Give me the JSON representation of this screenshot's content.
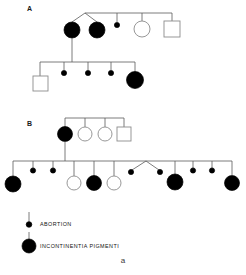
{
  "figure": {
    "caption": "a",
    "panels": [
      {
        "id": "A",
        "label": "A",
        "generations": [
          {
            "name": "generation-1",
            "members": [
              {
                "symbol": "filled-circle",
                "meaning": "incontinentia-pigmenti"
              },
              {
                "symbol": "filled-circle",
                "meaning": "incontinentia-pigmenti"
              },
              {
                "symbol": "dot",
                "meaning": "abortion"
              },
              {
                "symbol": "open-circle",
                "meaning": "unaffected-female"
              },
              {
                "symbol": "open-square",
                "meaning": "unaffected-male"
              }
            ]
          },
          {
            "name": "generation-2",
            "members": [
              {
                "symbol": "open-square",
                "meaning": "unaffected-male"
              },
              {
                "symbol": "dot",
                "meaning": "abortion"
              },
              {
                "symbol": "dot",
                "meaning": "abortion"
              },
              {
                "symbol": "dot",
                "meaning": "abortion"
              },
              {
                "symbol": "filled-circle",
                "meaning": "incontinentia-pigmenti"
              }
            ]
          }
        ]
      },
      {
        "id": "B",
        "label": "B",
        "generations": [
          {
            "name": "generation-1",
            "members": [
              {
                "symbol": "filled-circle",
                "meaning": "incontinentia-pigmenti"
              },
              {
                "symbol": "open-circle",
                "meaning": "unaffected-female"
              },
              {
                "symbol": "open-circle",
                "meaning": "unaffected-female"
              },
              {
                "symbol": "open-square",
                "meaning": "unaffected-male"
              }
            ]
          },
          {
            "name": "generation-2",
            "members": [
              {
                "symbol": "filled-circle",
                "meaning": "incontinentia-pigmenti"
              },
              {
                "symbol": "dot",
                "meaning": "abortion"
              },
              {
                "symbol": "dot",
                "meaning": "abortion"
              },
              {
                "symbol": "open-circle",
                "meaning": "unaffected-female"
              },
              {
                "symbol": "filled-circle",
                "meaning": "incontinentia-pigmenti"
              },
              {
                "symbol": "open-circle",
                "meaning": "unaffected-female"
              },
              {
                "symbol": "dot",
                "meaning": "abortion-twin"
              },
              {
                "symbol": "dot",
                "meaning": "abortion-twin"
              },
              {
                "symbol": "filled-circle",
                "meaning": "incontinentia-pigmenti"
              },
              {
                "symbol": "dot",
                "meaning": "abortion"
              },
              {
                "symbol": "dot",
                "meaning": "abortion"
              },
              {
                "symbol": "filled-circle",
                "meaning": "incontinentia-pigmenti"
              }
            ]
          }
        ]
      }
    ],
    "legend": [
      {
        "symbol": "dot",
        "label": "ABORTION"
      },
      {
        "symbol": "filled-circle",
        "label": "INCONTINENTIA PIGMENTI"
      }
    ],
    "colors": {
      "affected": "#000000",
      "unaffected_stroke": "#8c8c8c",
      "line": "#5a5a5a",
      "background": "#ffffff"
    }
  }
}
